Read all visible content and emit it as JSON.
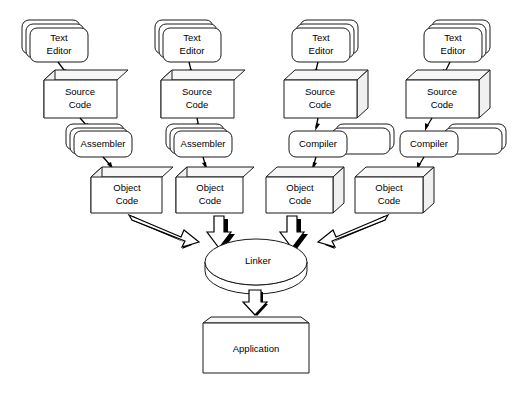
{
  "diagram": {
    "type": "flowchart",
    "background_color": "#ffffff",
    "line_color": "#1a1a1a",
    "shape_fill": "#ffffff",
    "shade_fill": "#f0f0f0",
    "columns": [
      {
        "id": "column-1",
        "translator": "Assembler",
        "nodes": [
          {
            "id": "text-editor-1",
            "label_line1": "Text",
            "label_line2": "Editor",
            "shape": "stacked-rounded-rect"
          },
          {
            "id": "source-code-1",
            "label_line1": "Source",
            "label_line2": "Code",
            "shape": "cube-left"
          },
          {
            "id": "assembler-1",
            "label_line1": "Assembler",
            "label_line2": "",
            "shape": "stacked-rounded-rect"
          },
          {
            "id": "object-code-1",
            "label_line1": "Object",
            "label_line2": "Code",
            "shape": "cube-left"
          }
        ]
      },
      {
        "id": "column-2",
        "translator": "Assembler",
        "nodes": [
          {
            "id": "text-editor-2",
            "label_line1": "Text",
            "label_line2": "Editor",
            "shape": "stacked-rounded-rect"
          },
          {
            "id": "source-code-2",
            "label_line1": "Source",
            "label_line2": "Code",
            "shape": "cube-left"
          },
          {
            "id": "assembler-2",
            "label_line1": "Assembler",
            "label_line2": "",
            "shape": "stacked-rounded-rect"
          },
          {
            "id": "object-code-2",
            "label_line1": "Object",
            "label_line2": "Code",
            "shape": "cube-left"
          }
        ]
      },
      {
        "id": "column-3",
        "translator": "Compiler",
        "nodes": [
          {
            "id": "text-editor-3",
            "label_line1": "Text",
            "label_line2": "Editor",
            "shape": "stacked-rounded-rect"
          },
          {
            "id": "source-code-3",
            "label_line1": "Source",
            "label_line2": "Code",
            "shape": "cube-right"
          },
          {
            "id": "compiler-3",
            "label_line1": "Compiler",
            "label_line2": "",
            "shape": "stacked-rounded-rect"
          },
          {
            "id": "object-code-3",
            "label_line1": "Object",
            "label_line2": "Code",
            "shape": "cube-right"
          }
        ]
      },
      {
        "id": "column-4",
        "translator": "Compiler",
        "nodes": [
          {
            "id": "text-editor-4",
            "label_line1": "Text",
            "label_line2": "Editor",
            "shape": "stacked-rounded-rect"
          },
          {
            "id": "source-code-4",
            "label_line1": "Source",
            "label_line2": "Code",
            "shape": "cube-right"
          },
          {
            "id": "compiler-4",
            "label_line1": "Compiler",
            "label_line2": "",
            "shape": "stacked-rounded-rect"
          },
          {
            "id": "object-code-4",
            "label_line1": "Object",
            "label_line2": "Code",
            "shape": "cube-right"
          }
        ]
      }
    ],
    "linker": {
      "id": "linker",
      "label": "Linker",
      "shape": "disk"
    },
    "application": {
      "id": "application",
      "label": "Application",
      "shape": "beveled-box"
    },
    "labels": {
      "text_editor": "Text Editor",
      "source_code": "Source Code",
      "assembler": "Assembler",
      "compiler": "Compiler",
      "object_code": "Object Code",
      "linker": "Linker",
      "application": "Application"
    }
  }
}
